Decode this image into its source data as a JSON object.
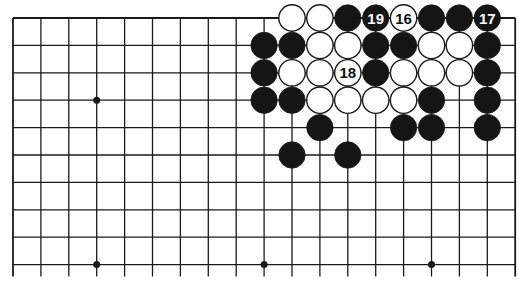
{
  "diagram": {
    "type": "go-board",
    "grid": {
      "columns": 19,
      "visible_rows": 10,
      "origin_x": 13,
      "origin_y": 18,
      "spacing_x": 27.9,
      "spacing_y": 27.4,
      "line_extension_bottom": 12,
      "top_edge": true,
      "left_edge": true,
      "right_edge": true
    },
    "colors": {
      "line": "#1a1a1a",
      "black_stone": "#151515",
      "white_stone": "#ffffff",
      "background": "#ffffff"
    },
    "star_points": [
      {
        "col": 3,
        "row": 3
      },
      {
        "col": 3,
        "row": 9
      },
      {
        "col": 9,
        "row": 9
      },
      {
        "col": 15,
        "row": 9
      }
    ],
    "stones": [
      {
        "col": 10,
        "row": 0,
        "color": "white"
      },
      {
        "col": 11,
        "row": 0,
        "color": "white"
      },
      {
        "col": 12,
        "row": 0,
        "color": "black"
      },
      {
        "col": 13,
        "row": 0,
        "color": "black",
        "label": "19"
      },
      {
        "col": 14,
        "row": 0,
        "color": "white",
        "label": "16"
      },
      {
        "col": 15,
        "row": 0,
        "color": "black"
      },
      {
        "col": 16,
        "row": 0,
        "color": "black"
      },
      {
        "col": 17,
        "row": 0,
        "color": "black",
        "label": "17"
      },
      {
        "col": 9,
        "row": 1,
        "color": "black"
      },
      {
        "col": 10,
        "row": 1,
        "color": "black"
      },
      {
        "col": 11,
        "row": 1,
        "color": "white"
      },
      {
        "col": 12,
        "row": 1,
        "color": "white"
      },
      {
        "col": 13,
        "row": 1,
        "color": "black"
      },
      {
        "col": 14,
        "row": 1,
        "color": "black"
      },
      {
        "col": 15,
        "row": 1,
        "color": "white"
      },
      {
        "col": 16,
        "row": 1,
        "color": "white"
      },
      {
        "col": 17,
        "row": 1,
        "color": "black"
      },
      {
        "col": 9,
        "row": 2,
        "color": "black"
      },
      {
        "col": 10,
        "row": 2,
        "color": "white"
      },
      {
        "col": 11,
        "row": 2,
        "color": "white"
      },
      {
        "col": 12,
        "row": 2,
        "color": "white",
        "label": "18"
      },
      {
        "col": 13,
        "row": 2,
        "color": "black"
      },
      {
        "col": 14,
        "row": 2,
        "color": "white"
      },
      {
        "col": 15,
        "row": 2,
        "color": "white"
      },
      {
        "col": 16,
        "row": 2,
        "color": "white"
      },
      {
        "col": 17,
        "row": 2,
        "color": "black"
      },
      {
        "col": 9,
        "row": 3,
        "color": "black"
      },
      {
        "col": 10,
        "row": 3,
        "color": "black"
      },
      {
        "col": 11,
        "row": 3,
        "color": "white"
      },
      {
        "col": 12,
        "row": 3,
        "color": "white"
      },
      {
        "col": 13,
        "row": 3,
        "color": "white"
      },
      {
        "col": 14,
        "row": 3,
        "color": "white"
      },
      {
        "col": 15,
        "row": 3,
        "color": "black"
      },
      {
        "col": 17,
        "row": 3,
        "color": "black"
      },
      {
        "col": 11,
        "row": 4,
        "color": "black"
      },
      {
        "col": 14,
        "row": 4,
        "color": "black"
      },
      {
        "col": 15,
        "row": 4,
        "color": "black"
      },
      {
        "col": 17,
        "row": 4,
        "color": "black"
      },
      {
        "col": 10,
        "row": 5,
        "color": "black"
      },
      {
        "col": 12,
        "row": 5,
        "color": "black"
      }
    ]
  }
}
